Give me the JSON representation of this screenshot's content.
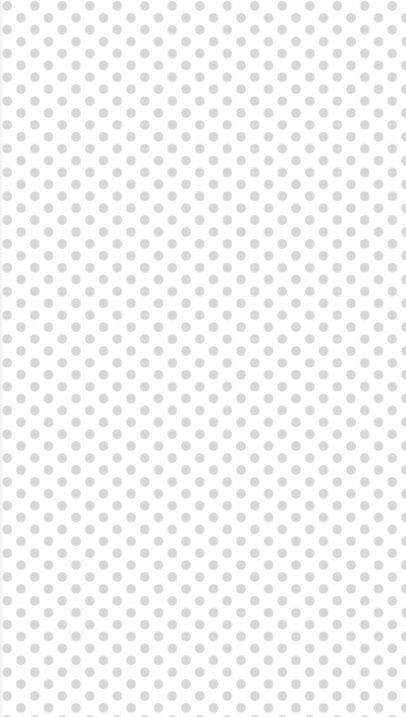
{
  "background": {
    "pattern": "staggered-dot-grid",
    "base_color": "#ffffff",
    "dot_color": "#d7d7d7",
    "dot_diameter_px": 10,
    "horizontal_pitch_px": 27.5,
    "vertical_pitch_px": 23.8
  }
}
